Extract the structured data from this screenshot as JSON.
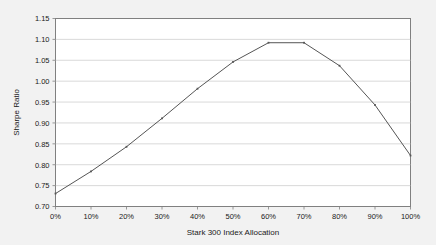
{
  "chart_data": {
    "type": "line",
    "title": "",
    "xlabel": "Stark 300 Index Allocation",
    "ylabel": "Sharpe Ratio",
    "x": [
      "0%",
      "10%",
      "20%",
      "30%",
      "40%",
      "50%",
      "60%",
      "70%",
      "80%",
      "90%",
      "100%"
    ],
    "values": [
      0.731,
      0.784,
      0.843,
      0.911,
      0.982,
      1.046,
      1.092,
      1.092,
      1.037,
      0.943,
      0.822
    ],
    "series": [
      {
        "name": "Sharpe Ratio",
        "values": [
          0.731,
          0.784,
          0.843,
          0.911,
          0.982,
          1.046,
          1.092,
          1.092,
          1.037,
          0.943,
          0.822
        ]
      }
    ],
    "xlim": [
      0,
      100
    ],
    "ylim": [
      0.7,
      1.15
    ],
    "ytick_labels": [
      "1.15",
      "1.10",
      "1.05",
      "1.00",
      "0.95",
      "0.90",
      "0.85",
      "0.80",
      "0.75",
      "0.70"
    ],
    "ytick_values": [
      1.15,
      1.1,
      1.05,
      1.0,
      0.95,
      0.9,
      0.85,
      0.8,
      0.75,
      0.7
    ],
    "xtick_labels": [
      "0%",
      "10%",
      "20%",
      "30%",
      "40%",
      "50%",
      "60%",
      "70%",
      "80%",
      "90%",
      "100%"
    ],
    "xtick_values": [
      0,
      10,
      20,
      30,
      40,
      50,
      60,
      70,
      80,
      90,
      100
    ],
    "grid": "horizontal",
    "legend": "none",
    "colors": {
      "line": "#555555",
      "grid": "#c9c9c9",
      "border": "#808080",
      "plot_background": "#ffffff",
      "figure_background": "#f2f2f2",
      "text": "#1a1a1a"
    }
  }
}
